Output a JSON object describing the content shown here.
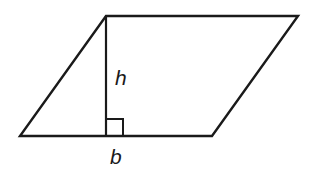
{
  "diagram": {
    "shape": "parallelogram",
    "labels": {
      "height": "h",
      "base": "b"
    },
    "vertices": {
      "top_left": [
        106,
        16
      ],
      "top_right": [
        298,
        16
      ],
      "bottom_right": [
        212,
        136
      ],
      "bottom_left": [
        20,
        136
      ]
    },
    "height_line": {
      "from": [
        106,
        16
      ],
      "to": [
        106,
        136
      ]
    },
    "right_angle_marker": {
      "x": 106,
      "y": 119,
      "size": 17
    },
    "stroke_color": "#1a1a1a",
    "background_color": "#ffffff"
  }
}
